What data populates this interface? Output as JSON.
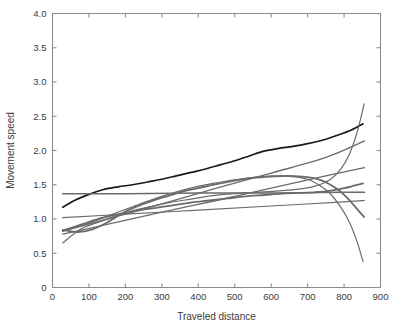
{
  "chart_data": {
    "type": "line",
    "title": "",
    "xlabel": "Traveled distance",
    "ylabel": "Movement speed",
    "xlim": [
      0,
      900
    ],
    "ylim": [
      0,
      4.0
    ],
    "xticks": [
      0,
      100,
      200,
      300,
      400,
      500,
      600,
      700,
      800,
      900
    ],
    "xtick_labels": [
      "0",
      "100",
      "200",
      "300",
      "400",
      "500",
      "600",
      "700",
      "800",
      "900"
    ],
    "yticks": [
      0,
      0.5,
      1.0,
      1.5,
      2.0,
      2.5,
      3.0,
      3.5,
      4.0
    ],
    "ytick_labels": [
      "0",
      "0.5",
      "1.0",
      "1.5",
      "2.0",
      "2.5",
      "3.0",
      "3.5",
      "4.0"
    ],
    "grid": false,
    "legend": "none",
    "series": [
      {
        "name": "mean-speed-curve",
        "color": "#1a1a1a",
        "width": 1.7,
        "x": [
          28,
          60,
          100,
          140,
          180,
          220,
          260,
          300,
          340,
          380,
          420,
          460,
          500,
          540,
          580,
          620,
          660,
          700,
          740,
          780,
          820,
          852
        ],
        "y": [
          1.17,
          1.27,
          1.36,
          1.43,
          1.47,
          1.5,
          1.54,
          1.58,
          1.63,
          1.68,
          1.73,
          1.79,
          1.85,
          1.92,
          1.99,
          2.03,
          2.06,
          2.1,
          2.15,
          2.22,
          2.3,
          2.39
        ]
      },
      {
        "name": "steep-rising-curve",
        "color": "#6b6b6b",
        "width": 1.2,
        "x": [
          28,
          80,
          140,
          200,
          260,
          320,
          380,
          440,
          500,
          560,
          620,
          680,
          720,
          760,
          790,
          815,
          835,
          848,
          855
        ],
        "y": [
          0.65,
          0.86,
          0.98,
          1.09,
          1.17,
          1.24,
          1.29,
          1.34,
          1.37,
          1.39,
          1.41,
          1.44,
          1.48,
          1.57,
          1.72,
          1.95,
          2.25,
          2.52,
          2.68
        ]
      },
      {
        "name": "steep-falling-curve",
        "color": "#6b6b6b",
        "width": 1.2,
        "x": [
          28,
          90,
          160,
          230,
          300,
          370,
          440,
          510,
          570,
          620,
          660,
          700,
          730,
          760,
          790,
          815,
          835,
          852
        ],
        "y": [
          0.84,
          0.92,
          1.06,
          1.2,
          1.33,
          1.44,
          1.52,
          1.58,
          1.62,
          1.63,
          1.62,
          1.58,
          1.5,
          1.38,
          1.18,
          0.95,
          0.68,
          0.38
        ]
      },
      {
        "name": "rising-then-plateau-curve",
        "color": "#6b6b6b",
        "width": 1.8,
        "x": [
          28,
          70,
          110,
          150,
          200,
          250,
          300,
          350,
          400,
          450,
          500,
          550,
          600,
          650,
          700,
          740,
          780,
          810,
          840,
          855
        ],
        "y": [
          0.84,
          0.81,
          0.85,
          0.95,
          1.11,
          1.22,
          1.31,
          1.39,
          1.45,
          1.51,
          1.56,
          1.6,
          1.62,
          1.63,
          1.61,
          1.56,
          1.44,
          1.3,
          1.12,
          1.03
        ]
      },
      {
        "name": "lower-rising-curve",
        "color": "#6b6b6b",
        "width": 1.8,
        "x": [
          28,
          80,
          130,
          180,
          230,
          280,
          330,
          380,
          430,
          480,
          530,
          580,
          630,
          680,
          720,
          760,
          800,
          830,
          852
        ],
        "y": [
          0.83,
          0.92,
          1.01,
          1.07,
          1.12,
          1.16,
          1.2,
          1.24,
          1.27,
          1.3,
          1.33,
          1.35,
          1.37,
          1.38,
          1.39,
          1.41,
          1.45,
          1.49,
          1.52
        ]
      },
      {
        "name": "shallow-line-upper",
        "color": "#6b6b6b",
        "width": 1.2,
        "x": [
          28,
          200,
          400,
          600,
          800,
          856
        ],
        "y": [
          1.02,
          1.07,
          1.13,
          1.19,
          1.25,
          1.27
        ]
      },
      {
        "name": "flat-line-mid",
        "color": "#6b6b6b",
        "width": 1.5,
        "x": [
          28,
          200,
          400,
          600,
          800,
          856
        ],
        "y": [
          1.37,
          1.37,
          1.38,
          1.38,
          1.39,
          1.39
        ]
      },
      {
        "name": "diagonal-line-steady",
        "color": "#6b6b6b",
        "width": 1.3,
        "x": [
          28,
          150,
          300,
          450,
          600,
          750,
          856
        ],
        "y": [
          0.78,
          0.92,
          1.1,
          1.27,
          1.45,
          1.63,
          1.75
        ]
      },
      {
        "name": "diagonal-line-steep",
        "color": "#6b6b6b",
        "width": 1.4,
        "x": [
          28,
          150,
          300,
          450,
          600,
          750,
          856
        ],
        "y": [
          0.82,
          1.0,
          1.22,
          1.45,
          1.67,
          1.9,
          2.14
        ]
      }
    ]
  },
  "figure": {
    "background_color": "#ffffff",
    "axis_color": "#8d8d8d",
    "text_color": "#3b3b3b"
  }
}
